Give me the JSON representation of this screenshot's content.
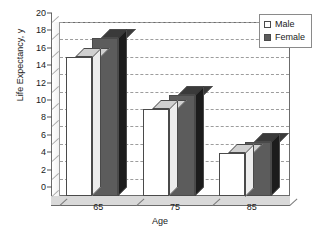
{
  "chart_data": {
    "type": "bar",
    "title": "",
    "xlabel": "Age",
    "ylabel": "Life Expectancy, y",
    "categories": [
      "65",
      "75",
      "85"
    ],
    "series": [
      {
        "name": "Male",
        "values": [
          16.0,
          10.0,
          5.0
        ]
      },
      {
        "name": "Female",
        "values": [
          18.2,
          11.6,
          6.2
        ]
      }
    ],
    "ylim": [
      0,
      20
    ],
    "ytick_step": 2,
    "yticks": [
      0,
      2,
      4,
      6,
      8,
      10,
      12,
      14,
      16,
      18,
      20
    ],
    "ytick_labels": [
      "0",
      "2",
      "4",
      "6",
      "8",
      "10",
      "12",
      "14",
      "16",
      "18",
      "20"
    ],
    "grid": true,
    "grid_style": "dashed-horizontal",
    "legend_position": "top-right",
    "style": "3d-column",
    "colors": {
      "male_fill": "#ffffff",
      "female_fill": "#5c5c5c",
      "outline": "#4a4a4a",
      "gridline": "#9d9d9d",
      "floor": "#d9d9d9",
      "plot_background": "#ffffff"
    }
  },
  "legend": {
    "items": [
      {
        "label": "Male",
        "swatch": "white-square-icon"
      },
      {
        "label": "Female",
        "swatch": "dark-square-icon"
      }
    ]
  }
}
